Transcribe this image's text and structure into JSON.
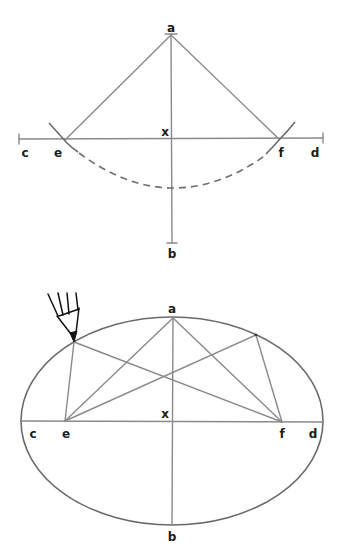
{
  "diagram": {
    "title": "",
    "figures": [
      {
        "id": "construction-foci",
        "description": "Locating the foci e and f by swinging an arc of radius cx from point a across the major axis c-d",
        "labels": {
          "a": "a",
          "b": "b",
          "c": "c",
          "d": "d",
          "e": "e",
          "f": "f",
          "x": "x"
        }
      },
      {
        "id": "drawing-ellipse",
        "description": "Drawing the ellipse with a pencil held against a loop of string around foci e and f",
        "labels": {
          "a": "a",
          "b": "b",
          "c": "c",
          "d": "d",
          "e": "e",
          "f": "f",
          "x": "x"
        },
        "icon": "pencil-icon"
      }
    ],
    "colors": {
      "line": "#8a8a8a",
      "arc": "#6a6a6a",
      "label": "#1a1a1a",
      "pencil": "#111111",
      "background": "#ffffff"
    }
  }
}
